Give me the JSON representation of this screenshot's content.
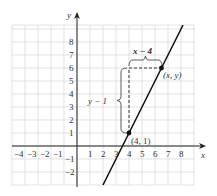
{
  "chart_data": {
    "type": "line",
    "title": "",
    "xlabel": "x",
    "ylabel": "y",
    "xlim": [
      -5,
      9
    ],
    "ylim": [
      -3,
      9.3
    ],
    "grid": true,
    "x_ticks": [
      "-4",
      "-3",
      "-2",
      "-1",
      "1",
      "2",
      "3",
      "4",
      "5",
      "6",
      "7",
      "8"
    ],
    "y_ticks": [
      "8",
      "7",
      "6",
      "5",
      "4",
      "3",
      "2",
      "1",
      "-1",
      "-2"
    ],
    "series": [
      {
        "name": "line",
        "equation": "y = 2x - 7",
        "x": [
          2,
          8.15
        ],
        "y": [
          -3,
          9.3
        ]
      }
    ],
    "points": [
      {
        "label": "(4, 1)",
        "x": 4,
        "y": 1
      },
      {
        "label": "(x, y)",
        "x": 6.5,
        "y": 6
      }
    ],
    "annotations": [
      {
        "text": "x − 4",
        "type": "horizontal-brace",
        "from": [
          4,
          6
        ],
        "to": [
          6.5,
          6
        ]
      },
      {
        "text": "y − 1",
        "type": "vertical-brace",
        "from": [
          4,
          1
        ],
        "to": [
          4,
          6
        ]
      }
    ]
  },
  "labels": {
    "x_axis": "x",
    "y_axis": "y",
    "x_neg": [
      "−4",
      "−3",
      "−2",
      "−1"
    ],
    "x_pos": [
      "1",
      "2",
      "3",
      "4",
      "5",
      "6",
      "7",
      "8"
    ],
    "y_pos": [
      "1",
      "2",
      "3",
      "4",
      "5",
      "6",
      "7",
      "8"
    ],
    "y_neg": [
      "−1",
      "−2"
    ],
    "point_a": "(4, 1)",
    "point_b": "(x, y)",
    "run": "x − 4",
    "rise": "y − 1"
  }
}
